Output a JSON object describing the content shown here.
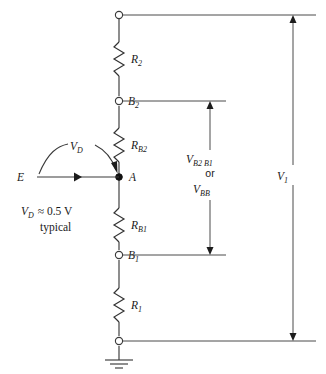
{
  "figure": {
    "kind": "circuit-diagram",
    "background_color": "#ffffff",
    "line_color": "#3a3a3a",
    "text_color": "#1a1a1a"
  },
  "components": {
    "r2": {
      "label": "R",
      "sub": "2"
    },
    "rb2": {
      "label": "R",
      "sub": "B2"
    },
    "rb1": {
      "label": "R",
      "sub": "B1"
    },
    "r1": {
      "label": "R",
      "sub": "1"
    }
  },
  "nodes": {
    "b2": {
      "label": "B",
      "sub": "2"
    },
    "b1": {
      "label": "B",
      "sub": "1"
    },
    "a": {
      "label": "A"
    },
    "emitter": {
      "label": "E"
    },
    "top_terminal": {
      "label": ""
    },
    "bottom_terminal": {
      "label": ""
    }
  },
  "measurements": {
    "vd_arc": {
      "label": "V",
      "sub": "D"
    },
    "interbase": {
      "line1_label": "V",
      "line1_sub": "B2 B1",
      "line2": "or",
      "line3_label": "V",
      "line3_sub": "BB"
    },
    "v1": {
      "label": "V",
      "sub": "1"
    }
  },
  "annotation": {
    "line1": "V",
    "line1_sub": "D",
    "line1_rest": "≈ 0.5 V",
    "line2": "typical"
  }
}
